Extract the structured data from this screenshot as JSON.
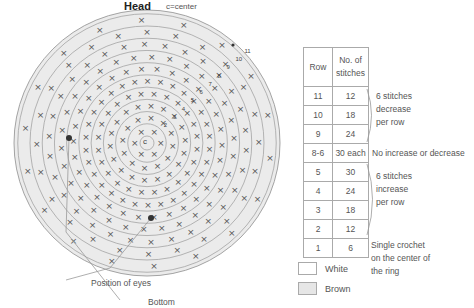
{
  "header": {
    "title": "Head",
    "subtitle": "c=center"
  },
  "diagram": {
    "center_label": "c",
    "ring_count": 11,
    "ring_labels": [
      "2",
      "3",
      "4",
      "5",
      "6",
      "7",
      "8",
      "9",
      "10",
      "11"
    ],
    "eye_caption": "Position of eyes",
    "bottom_caption": "Bottom",
    "colors": {
      "fill": "#ebebeb",
      "ring": "#9a9a9a",
      "stitch": "#555555",
      "eye": "#333333"
    }
  },
  "table": {
    "headers": [
      "Row",
      "No. of stitches"
    ],
    "rows": [
      {
        "row": "11",
        "stitches": "12"
      },
      {
        "row": "10",
        "stitches": "18"
      },
      {
        "row": "9",
        "stitches": "24"
      },
      {
        "row": "8-6",
        "stitches": "30 each"
      },
      {
        "row": "5",
        "stitches": "30"
      },
      {
        "row": "4",
        "stitches": "24"
      },
      {
        "row": "3",
        "stitches": "18"
      },
      {
        "row": "2",
        "stitches": "12"
      },
      {
        "row": "1",
        "stitches": "6"
      }
    ],
    "notes": {
      "decrease": [
        "6 stitches",
        "decrease",
        "per row"
      ],
      "constant": "No increase or decrease",
      "increase": [
        "6 stitches",
        "increase",
        "per row"
      ],
      "start": [
        "Single crochet",
        "on the center of",
        "the ring"
      ]
    }
  },
  "legend": [
    {
      "label": "White",
      "color": "#ffffff"
    },
    {
      "label": "Brown",
      "color": "#e6e6e6"
    }
  ]
}
